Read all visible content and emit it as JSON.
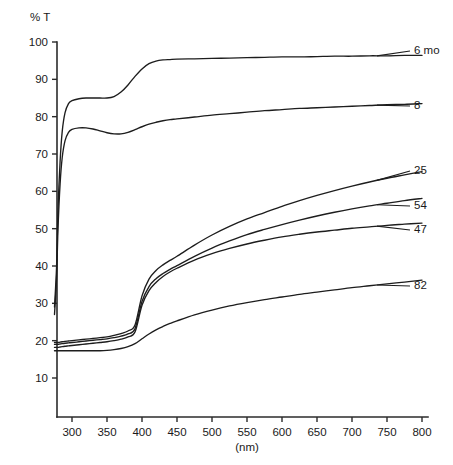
{
  "chart_data": {
    "type": "line",
    "title": "",
    "ylabel": "% T",
    "xlabel": "(nm)",
    "xlim": [
      275,
      800
    ],
    "ylim": [
      8,
      100
    ],
    "grid": false,
    "legend_position": "right-inline-labels",
    "xticks": [
      300,
      350,
      400,
      450,
      500,
      550,
      600,
      650,
      700,
      750,
      800
    ],
    "yticks": [
      10,
      20,
      30,
      40,
      50,
      60,
      70,
      80,
      90,
      100
    ],
    "x": [
      275,
      278,
      280,
      283,
      286,
      290,
      295,
      300,
      310,
      320,
      330,
      340,
      350,
      360,
      370,
      380,
      390,
      400,
      410,
      420,
      430,
      440,
      450,
      475,
      500,
      525,
      550,
      575,
      600,
      625,
      650,
      675,
      700,
      725,
      750,
      775,
      800
    ],
    "series": [
      {
        "name": "6 mo",
        "label": "6 mo",
        "values": [
          29,
          40,
          55,
          68,
          76,
          81,
          83.5,
          84.3,
          84.8,
          85,
          85,
          85,
          85,
          85.4,
          86.6,
          88.5,
          90.8,
          92.8,
          94.2,
          94.9,
          95.2,
          95.3,
          95.4,
          95.5,
          95.6,
          95.7,
          95.8,
          95.9,
          96,
          96,
          96.1,
          96.2,
          96.2,
          96.3,
          96.3,
          96.4,
          96.4
        ]
      },
      {
        "name": "8",
        "label": "8",
        "values": [
          27,
          37,
          50,
          62,
          69,
          73.5,
          75.8,
          76.6,
          77,
          77,
          76.7,
          76.2,
          75.7,
          75.4,
          75.4,
          75.8,
          76.5,
          77.3,
          78,
          78.5,
          78.9,
          79.2,
          79.4,
          79.9,
          80.4,
          80.8,
          81.2,
          81.6,
          81.9,
          82.2,
          82.4,
          82.6,
          82.8,
          83,
          83.2,
          83.3,
          83.5
        ]
      },
      {
        "name": "25",
        "label": "25",
        "values": [
          19.5,
          19.5,
          19.5,
          19.6,
          19.7,
          19.8,
          19.9,
          20,
          20.2,
          20.4,
          20.6,
          20.8,
          21,
          21.4,
          21.9,
          22.6,
          24.2,
          32,
          36.5,
          38.8,
          40.3,
          41.5,
          42.6,
          45.6,
          48.3,
          50.6,
          52.6,
          54.3,
          56,
          57.5,
          58.9,
          60.2,
          61.4,
          62.5,
          63.5,
          64.4,
          65.3
        ]
      },
      {
        "name": "54",
        "label": "54",
        "values": [
          19,
          19,
          19,
          19.1,
          19.2,
          19.3,
          19.4,
          19.5,
          19.7,
          19.9,
          20.1,
          20.3,
          20.5,
          20.8,
          21.2,
          21.8,
          23.2,
          30.5,
          34.5,
          36.6,
          38,
          39.1,
          40.1,
          42.6,
          44.8,
          46.7,
          48.4,
          49.8,
          51.1,
          52.3,
          53.4,
          54.4,
          55.3,
          56.1,
          56.8,
          57.5,
          58.1
        ]
      },
      {
        "name": "47",
        "label": "47",
        "values": [
          18.2,
          18.2,
          18.2,
          18.3,
          18.4,
          18.5,
          18.6,
          18.7,
          18.9,
          19.1,
          19.3,
          19.5,
          19.7,
          20,
          20.4,
          21,
          22.3,
          29.5,
          33.4,
          35.6,
          37.2,
          38.4,
          39.4,
          41.6,
          43.3,
          44.7,
          45.9,
          46.9,
          47.8,
          48.5,
          49.1,
          49.6,
          50.1,
          50.5,
          50.9,
          51.2,
          51.5
        ]
      },
      {
        "name": "82",
        "label": "82",
        "values": [
          17.3,
          17.3,
          17.3,
          17.3,
          17.3,
          17.3,
          17.3,
          17.3,
          17.3,
          17.3,
          17.3,
          17.3,
          17.4,
          17.6,
          17.9,
          18.4,
          19.2,
          20.5,
          21.8,
          22.9,
          23.8,
          24.6,
          25.3,
          26.9,
          28.2,
          29.3,
          30.2,
          31,
          31.7,
          32.4,
          33,
          33.6,
          34.2,
          34.7,
          35.2,
          35.7,
          36.2
        ]
      }
    ]
  },
  "annotations": {
    "y_axis_title": "% T",
    "x_axis_unit": "(nm)"
  }
}
